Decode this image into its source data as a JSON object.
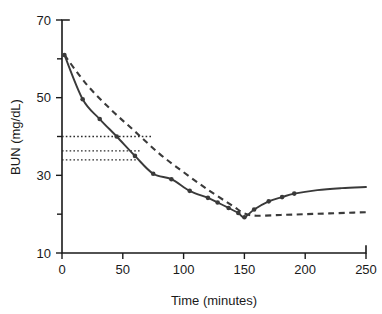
{
  "chart_data": {
    "type": "line",
    "title": "",
    "xlabel": "Time (minutes)",
    "ylabel": "BUN (mg/dL)",
    "xlim": [
      0,
      250
    ],
    "ylim": [
      10,
      70
    ],
    "xticks": [
      0,
      50,
      100,
      150,
      200,
      250
    ],
    "yticks": [
      10,
      30,
      50,
      70
    ],
    "xtick_labels": [
      "0",
      "50",
      "100",
      "150",
      "200",
      "250"
    ],
    "ytick_labels": [
      "10",
      "30",
      "50",
      "70"
    ],
    "grid": false,
    "legend": "none",
    "series": [
      {
        "name": "measured-bun-with-rebound",
        "style": "solid-with-markers",
        "color": "#3a3a3a",
        "x": [
          2,
          17,
          31,
          45,
          60,
          75,
          90,
          105,
          120,
          128,
          137,
          145,
          150,
          158,
          170,
          181,
          191
        ],
        "y": [
          61.0,
          49.6,
          44.5,
          40.0,
          35.0,
          30.4,
          29.0,
          26.0,
          24.2,
          23.0,
          21.6,
          20.3,
          19.2,
          21.2,
          23.3,
          24.4,
          25.3
        ]
      },
      {
        "name": "single-pool-model-fit",
        "style": "dashed",
        "color": "#3a3a3a",
        "x": [
          2,
          20,
          40,
          60,
          80,
          100,
          120,
          140,
          150,
          160,
          180,
          200,
          220,
          240,
          250
        ],
        "y": [
          61.0,
          53.5,
          47.0,
          41.3,
          35.6,
          30.8,
          26.3,
          22.2,
          20.2,
          19.6,
          19.8,
          20.0,
          20.2,
          20.4,
          20.5
        ]
      }
    ],
    "annotations": [
      {
        "name": "reference-line-upper",
        "type": "horizontal-dotted",
        "y": 40.0,
        "x_start": 0,
        "x_end": 74
      },
      {
        "name": "reference-line-middle",
        "type": "horizontal-dotted",
        "y": 36.3,
        "x_start": 0,
        "x_end": 64
      },
      {
        "name": "reference-line-lower",
        "type": "horizontal-dotted",
        "y": 34.0,
        "x_start": 0,
        "x_end": 62
      }
    ]
  }
}
